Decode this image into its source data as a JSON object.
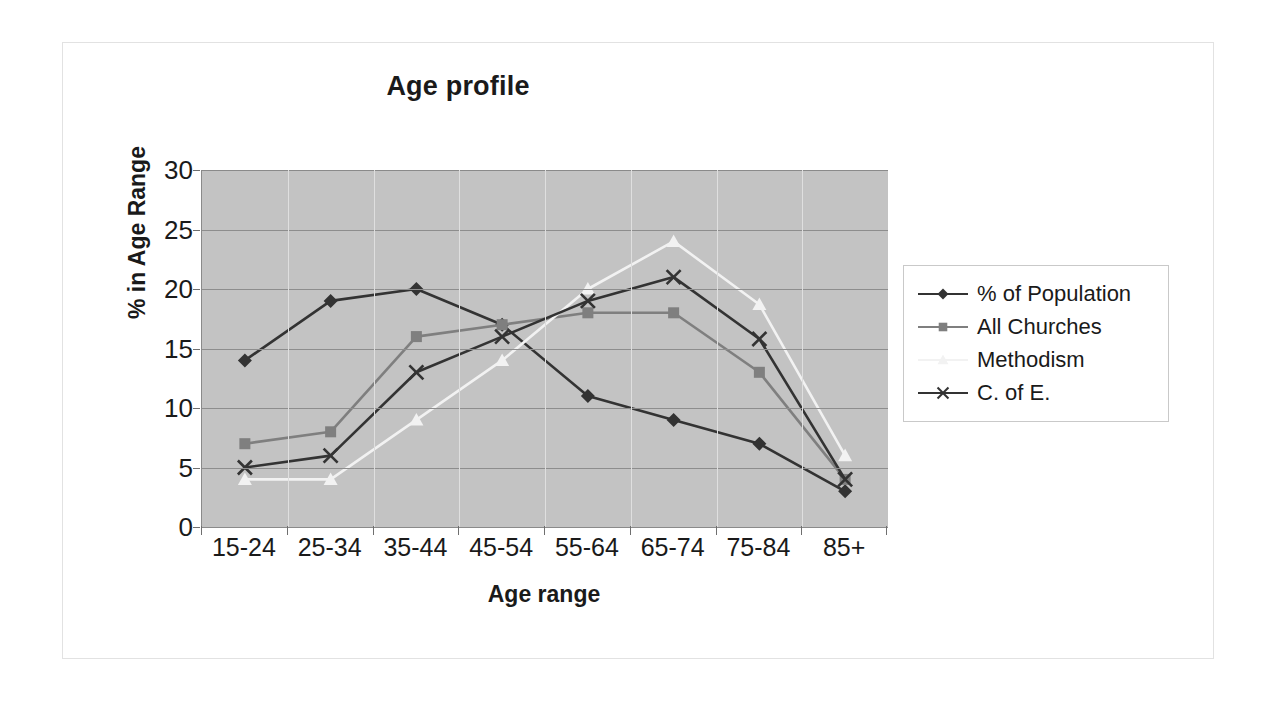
{
  "figure": {
    "title": "Age profile",
    "border_color": "#e2e2e2",
    "plot_background": "#c3c3c3",
    "gridline_color": "#8d8d8d"
  },
  "axes": {
    "x_title": "Age range",
    "y_title": "% in Age Range",
    "y_ticks": [
      "0",
      "5",
      "10",
      "15",
      "20",
      "25",
      "30"
    ],
    "x_ticks": [
      "15-24",
      "25-34",
      "35-44",
      "45-54",
      "55-64",
      "65-74",
      "75-84",
      "85+"
    ]
  },
  "legend": {
    "items": [
      {
        "label": "% of Population",
        "marker": "diamond-marker",
        "color": "#333333"
      },
      {
        "label": "All Churches",
        "marker": "square-marker",
        "color": "#7f7f7f"
      },
      {
        "label": "Methodism",
        "marker": "triangle-marker",
        "color": "#f2f2f2"
      },
      {
        "label": "C. of E.",
        "marker": "cross-marker",
        "color": "#333333"
      }
    ]
  },
  "chart_data": {
    "type": "line",
    "title": "Age profile",
    "xlabel": "Age range",
    "ylabel": "% in Age Range",
    "categories": [
      "15-24",
      "25-34",
      "35-44",
      "45-54",
      "55-64",
      "65-74",
      "75-84",
      "85+"
    ],
    "ylim": [
      0,
      30
    ],
    "ytick_step": 5,
    "grid": true,
    "legend_position": "right",
    "series": [
      {
        "name": "% of Population",
        "color": "#333333",
        "marker": "diamond",
        "values": [
          14,
          19,
          20,
          17,
          11,
          9,
          7,
          3
        ]
      },
      {
        "name": "All Churches",
        "color": "#7f7f7f",
        "marker": "square",
        "values": [
          7,
          8,
          16,
          17,
          18,
          18,
          13,
          4
        ]
      },
      {
        "name": "Methodism",
        "color": "#f2f2f2",
        "marker": "triangle",
        "values": [
          4,
          4,
          9,
          14,
          20,
          24,
          18.7,
          6
        ]
      },
      {
        "name": "C. of E.",
        "color": "#333333",
        "marker": "cross",
        "values": [
          5,
          6,
          13,
          16,
          19,
          21,
          15.8,
          4
        ]
      }
    ]
  }
}
